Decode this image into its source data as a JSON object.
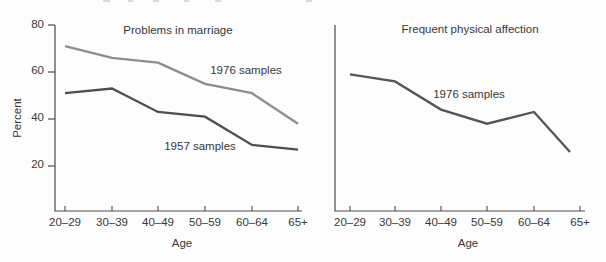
{
  "figure": {
    "ylabel": "Percent",
    "xlabel": "Age",
    "ytick_labels": [
      "80",
      "60",
      "40",
      "20"
    ],
    "xtick_labels": [
      "20–29",
      "30–39",
      "40–49",
      "50–59",
      "60–64",
      "65+"
    ],
    "text_color": "#383838",
    "axis_color": "#4a4a4a",
    "background": "#fdfdfd"
  },
  "chart_data": [
    {
      "type": "line",
      "title": "Problems in marriage",
      "xlabel": "Age",
      "ylabel": "Percent",
      "categories": [
        "20–29",
        "30–39",
        "40–49",
        "50–59",
        "60–64",
        "65+"
      ],
      "series": [
        {
          "name": "1976 samples",
          "values": [
            71,
            66,
            64,
            55,
            51,
            38
          ],
          "color": "#8d8d8d"
        },
        {
          "name": "1957 samples",
          "values": [
            51,
            53,
            43,
            41,
            29,
            27
          ],
          "color": "#4e4e4e"
        }
      ],
      "ylim": [
        0,
        80
      ],
      "yticks": [
        20,
        40,
        60,
        80
      ],
      "grid": false,
      "legend": "inline-labels"
    },
    {
      "type": "line",
      "title": "Frequent physical affection",
      "xlabel": "Age",
      "ylabel": "",
      "categories": [
        "20–29",
        "30–39",
        "40–49",
        "50–59",
        "60–64",
        "65+"
      ],
      "series": [
        {
          "name": "1976 samples",
          "values": [
            59,
            56,
            44,
            38,
            43,
            26
          ],
          "color": "#555555"
        }
      ],
      "ylim": [
        0,
        80
      ],
      "yticks": [],
      "grid": false,
      "legend": "inline-labels"
    }
  ]
}
